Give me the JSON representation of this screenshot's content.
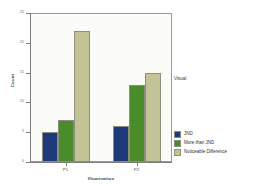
{
  "chart_data": {
    "type": "bar",
    "title": "",
    "xlabel": "Illumination",
    "ylabel": "Count",
    "categories": [
      "P1",
      "P2"
    ],
    "series": [
      {
        "name": "JND",
        "values": [
          5,
          6
        ],
        "color": "#1f3a7a"
      },
      {
        "name": "More than JND",
        "values": [
          7,
          13
        ],
        "color": "#4a8c2a"
      },
      {
        "name": "Noticeable Difference",
        "values": [
          22,
          15
        ],
        "color": "#c3c398"
      }
    ],
    "ylim": [
      0,
      25
    ],
    "yticks": [
      0,
      5,
      10,
      15,
      20,
      25
    ],
    "ytick_labels": [
      "0",
      "5",
      "10",
      "15",
      "20",
      "25"
    ],
    "grid": false,
    "legend_position": "bottom-right",
    "annotations": [
      "Visual"
    ]
  },
  "axes": {
    "y_title": "Count",
    "x_title": "Illumination",
    "y_ticks": [
      "25",
      "20",
      "15",
      "10",
      "5",
      "0"
    ],
    "x_ticks": [
      "P1",
      "P2"
    ]
  },
  "side_label": "Visual",
  "legend": {
    "items": [
      {
        "label": "JND",
        "color": "#1f3a7a"
      },
      {
        "label": "More than JND",
        "color": "#4a8c2a"
      },
      {
        "label": "Noticeable Difference",
        "color": "#c3c398"
      }
    ]
  },
  "colors": {
    "jnd": "#1f3a7a",
    "more_than_jnd": "#4a8c2a",
    "noticeable_difference": "#c3c398",
    "plot_background": "#fbfbf8",
    "frame": "#9a9a9a"
  }
}
